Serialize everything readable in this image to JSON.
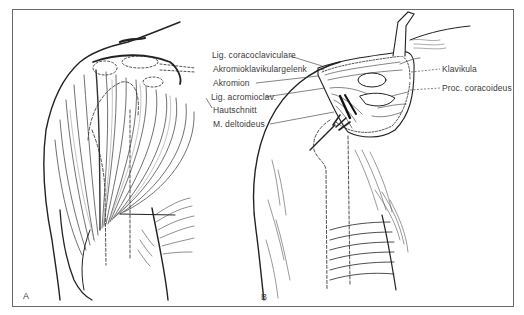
{
  "figure": {
    "panels": [
      {
        "id": "A",
        "label": "A"
      },
      {
        "id": "B",
        "label": "B"
      }
    ],
    "labels_left": [
      "Lig. coracoclaviculare",
      "Akromioklavikulargelenk",
      "Akromion",
      "Lig. acromioclav.",
      "Hautschnitt",
      "M. deltoideus"
    ],
    "labels_right": [
      "Klavikula",
      "Proc. coracoideus"
    ]
  }
}
